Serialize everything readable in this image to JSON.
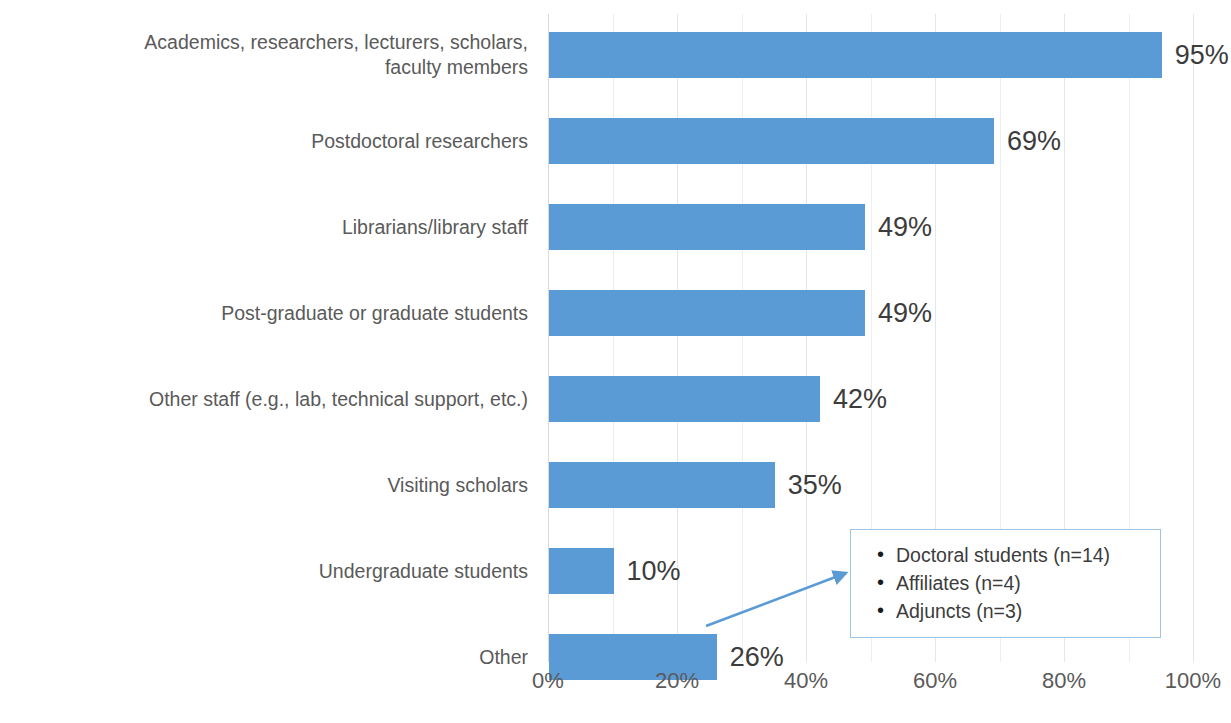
{
  "chart_data": {
    "type": "bar",
    "orientation": "horizontal",
    "title": "",
    "subtitle": "",
    "xlabel": "",
    "ylabel": "",
    "xlim": [
      0,
      100
    ],
    "xticks": [
      "0%",
      "20%",
      "40%",
      "60%",
      "80%",
      "100%"
    ],
    "xtick_values": [
      0,
      20,
      40,
      60,
      80,
      100
    ],
    "gridlines": true,
    "gridline_step": 10,
    "legend": "none",
    "bar_color": "#5B9BD5",
    "categories": [
      "Academics, researchers, lecturers, scholars,\nfaculty members",
      "Postdoctoral researchers",
      "Librarians/library staff",
      "Post-graduate or graduate students",
      "Other staff (e.g., lab, technical support, etc.)",
      "Visiting scholars",
      "Undergraduate students",
      "Other"
    ],
    "values": [
      95,
      69,
      49,
      49,
      42,
      35,
      10,
      26
    ],
    "value_labels": [
      "95%",
      "69%",
      "49%",
      "49%",
      "42%",
      "35%",
      "10%",
      "26%"
    ]
  },
  "annotation": {
    "target_category": "Other",
    "border_color": "#9DC3E6",
    "arrow_color": "#5B9BD5",
    "items": [
      "Doctoral students (n=14)",
      "Affiliates (n=4)",
      "Adjuncts (n=3)"
    ]
  }
}
